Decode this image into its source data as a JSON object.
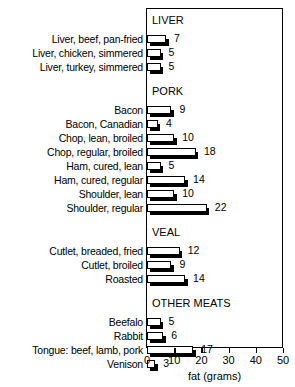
{
  "chart_data": {
    "type": "bar",
    "orientation": "horizontal",
    "title": "",
    "xlabel": "fat (grams)",
    "ylabel": "",
    "xlim": [
      0,
      50
    ],
    "xticks": [
      0,
      10,
      20,
      30,
      40,
      50
    ],
    "xtick_labels": [
      "0",
      "10",
      "20",
      "30",
      "40",
      "50"
    ],
    "grid": false,
    "legend": null,
    "frame": true,
    "units": "grams",
    "sections": [
      {
        "name": "LIVER",
        "categories": [
          "Liver, beef, pan-fried",
          "Liver, chicken, simmered",
          "Liver, turkey, simmered"
        ],
        "values": [
          7,
          5,
          5
        ]
      },
      {
        "name": "PORK",
        "categories": [
          "Bacon",
          "Bacon, Canadian",
          "Chop, lean, broiled",
          "Chop, regular, broiled",
          "Ham, cured, lean",
          "Ham, cured, regular",
          "Shoulder, lean",
          "Shoulder, regular"
        ],
        "values": [
          9,
          4,
          10,
          18,
          5,
          14,
          10,
          22
        ]
      },
      {
        "name": "VEAL",
        "categories": [
          "Cutlet, breaded, fried",
          "Cutlet, broiled",
          "Roasted"
        ],
        "values": [
          12,
          9,
          14
        ]
      },
      {
        "name": "OTHER MEATS",
        "categories": [
          "Beefalo",
          "Rabbit",
          "Tongue: beef, lamb, pork",
          "Venison"
        ],
        "values": [
          5,
          6,
          17,
          3
        ]
      }
    ],
    "categories": [
      "Liver, beef, pan-fried",
      "Liver, chicken, simmered",
      "Liver, turkey, simmered",
      "Bacon",
      "Bacon, Canadian",
      "Chop, lean, broiled",
      "Chop, regular, broiled",
      "Ham, cured, lean",
      "Ham, cured, regular",
      "Shoulder, lean",
      "Shoulder, regular",
      "Cutlet, breaded, fried",
      "Cutlet, broiled",
      "Roasted",
      "Beefalo",
      "Rabbit",
      "Tongue: beef, lamb, pork",
      "Venison"
    ],
    "values": [
      7,
      5,
      5,
      9,
      4,
      10,
      18,
      5,
      14,
      10,
      22,
      12,
      9,
      14,
      5,
      6,
      17,
      3
    ],
    "colors": {
      "bar_face": "#ffffff",
      "bar_edge": "#000000",
      "bar_shadow": "#000000",
      "frame": "#000000",
      "text": "#000000",
      "background": "#ffffff"
    }
  }
}
